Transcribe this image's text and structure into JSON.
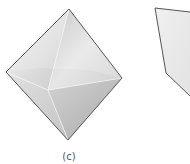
{
  "figure": {
    "panel_label": "(c)",
    "shapes": [
      {
        "name": "octahedron",
        "vertices": {
          "top": [
            69,
            9
          ],
          "left": [
            6,
            72
          ],
          "right": [
            122,
            78
          ],
          "bottom": [
            68,
            140
          ],
          "front": [
            48,
            90
          ]
        }
      },
      {
        "name": "partial-crystal-cropped",
        "vertices": {
          "top_left": [
            155,
            8
          ],
          "top_right": [
            190,
            12
          ],
          "bottom_left": [
            166,
            73
          ],
          "bottom_right": [
            190,
            96
          ]
        }
      }
    ],
    "colors": {
      "edge": "#555555",
      "face_light": "#f2f2f2",
      "face_mid": "#d4d4d4",
      "face_dark": "#b0b0b0",
      "background": "#ffffff"
    }
  }
}
